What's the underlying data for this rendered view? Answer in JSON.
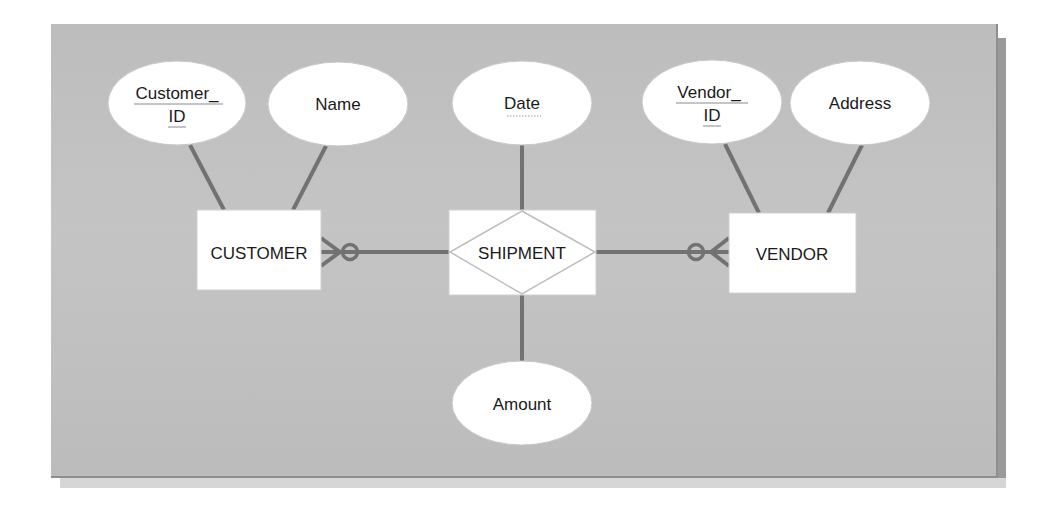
{
  "diagram": {
    "type": "entity-relationship",
    "colors": {
      "panel": "#c0c0c0",
      "connector": "#727272",
      "shape_fill": "#ffffff",
      "text": "#1a1a1a"
    },
    "entities": [
      {
        "id": "customer",
        "label": "CUSTOMER"
      },
      {
        "id": "vendor",
        "label": "VENDOR"
      }
    ],
    "relationship": {
      "id": "shipment",
      "label": "SHIPMENT"
    },
    "attributes": [
      {
        "id": "customer_id",
        "line1": "Customer_",
        "line2": "ID",
        "owner": "CUSTOMER",
        "key": "identifier"
      },
      {
        "id": "name",
        "label": "Name",
        "owner": "CUSTOMER"
      },
      {
        "id": "date",
        "label": "Date",
        "owner": "SHIPMENT",
        "key": "partial"
      },
      {
        "id": "vendor_id",
        "line1": "Vendor_",
        "line2": "ID",
        "owner": "VENDOR",
        "key": "identifier"
      },
      {
        "id": "address",
        "label": "Address",
        "owner": "VENDOR"
      },
      {
        "id": "amount",
        "label": "Amount",
        "owner": "SHIPMENT"
      }
    ],
    "connections": [
      {
        "from": "CUSTOMER",
        "to": "SHIPMENT",
        "cardinality_at_customer": "zero-or-many"
      },
      {
        "from": "SHIPMENT",
        "to": "VENDOR",
        "cardinality_at_vendor": "zero-or-many"
      }
    ]
  }
}
